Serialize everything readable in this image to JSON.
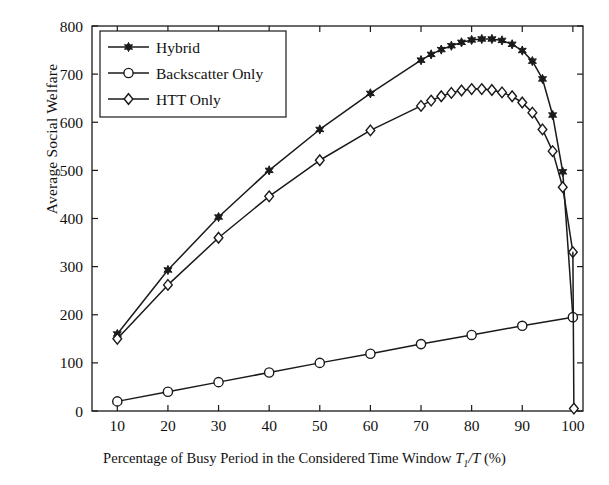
{
  "chart_data": {
    "type": "line",
    "title": "",
    "xlabel": "Percentage of Busy Period in the Considered Time Window T_1/T (%)",
    "xlabel_parts": {
      "pre": "Percentage of Busy Period in the Considered Time Window ",
      "sym": "T",
      "sub": "1",
      "post": "/T",
      "unit": " (%)"
    },
    "ylabel": "Average Social Welfare",
    "xlim": [
      5,
      102
    ],
    "ylim": [
      0,
      800
    ],
    "xticks": [
      10,
      20,
      30,
      40,
      50,
      60,
      70,
      80,
      90,
      100
    ],
    "yticks": [
      0,
      100,
      200,
      300,
      400,
      500,
      600,
      700,
      800
    ],
    "xticklabels": [
      "10",
      "20",
      "30",
      "40",
      "50",
      "60",
      "70",
      "80",
      "90",
      "100"
    ],
    "yticklabels": [
      "0",
      "100",
      "200",
      "300",
      "400",
      "500",
      "600",
      "700",
      "800"
    ],
    "grid": false,
    "legend_position": "upper left",
    "line_color": "#1a1a1a",
    "series": [
      {
        "name": "Hybrid",
        "marker": "hexagram-filled",
        "x": [
          10,
          20,
          30,
          40,
          50,
          60,
          70,
          72,
          74,
          76,
          78,
          80,
          82,
          84,
          86,
          88,
          90,
          92,
          94,
          96,
          98,
          100
        ],
        "y": [
          160,
          293,
          403,
          500,
          585,
          660,
          729,
          741,
          751,
          759,
          766,
          771,
          773,
          773,
          770,
          762,
          749,
          727,
          690,
          615,
          497,
          195
        ]
      },
      {
        "name": "Backscatter Only",
        "marker": "circle-open",
        "x": [
          10,
          20,
          30,
          40,
          50,
          60,
          70,
          80,
          90,
          100
        ],
        "y": [
          20,
          40,
          60,
          80,
          100,
          119,
          139,
          158,
          177,
          195
        ]
      },
      {
        "name": "HTT Only",
        "marker": "diamond-open",
        "x": [
          10,
          20,
          30,
          40,
          50,
          60,
          70,
          72,
          74,
          76,
          78,
          80,
          82,
          84,
          86,
          88,
          90,
          92,
          94,
          96,
          98,
          100
        ],
        "y": [
          150,
          262,
          360,
          446,
          521,
          583,
          634,
          645,
          654,
          661,
          666,
          669,
          669,
          667,
          662,
          654,
          641,
          620,
          585,
          540,
          465,
          330
        ]
      },
      {
        "name": "HTT Only Tail",
        "marker": "diamond-open",
        "x": [
          100,
          100.2
        ],
        "y": [
          330,
          5
        ]
      }
    ]
  },
  "legend": {
    "items": [
      {
        "label": "Hybrid",
        "marker": "hexagram-filled"
      },
      {
        "label": "Backscatter Only",
        "marker": "circle-open"
      },
      {
        "label": "HTT Only",
        "marker": "diamond-open"
      }
    ]
  }
}
